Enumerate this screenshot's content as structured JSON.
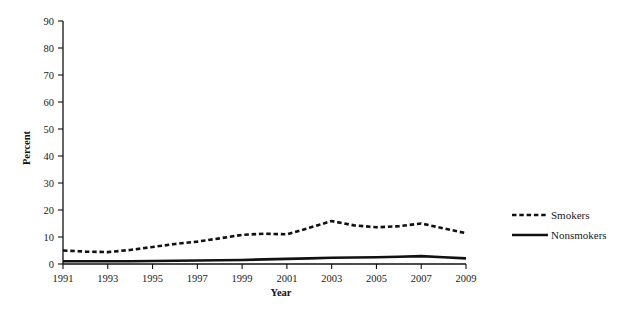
{
  "chart_data": {
    "type": "line",
    "title": "",
    "xlabel": "Year",
    "ylabel": "Percent",
    "xlim": [
      1991,
      2009
    ],
    "ylim": [
      0,
      90
    ],
    "grid": false,
    "legend_position": "right",
    "xticks": [
      "1991",
      "1993",
      "1995",
      "1997",
      "1999",
      "2001",
      "2003",
      "2005",
      "2007",
      "2009"
    ],
    "yticks": [
      "0",
      "10",
      "20",
      "30",
      "40",
      "50",
      "60",
      "70",
      "80",
      "90"
    ],
    "x": [
      1991,
      1992,
      1993,
      1994,
      1995,
      1996,
      1997,
      1998,
      1999,
      2000,
      2001,
      2002,
      2003,
      2004,
      2005,
      2006,
      2007,
      2008,
      2009
    ],
    "series": [
      {
        "name": "Smokers",
        "style": "dashed",
        "color": "#111111",
        "values": [
          5.0,
          4.6,
          4.4,
          5.2,
          6.3,
          7.4,
          8.3,
          9.5,
          10.8,
          11.2,
          11.0,
          13.4,
          15.9,
          14.3,
          13.6,
          14.0,
          15.0,
          13.2,
          11.4
        ]
      },
      {
        "name": "Nonsmokers",
        "style": "solid",
        "color": "#111111",
        "values": [
          1.0,
          1.0,
          1.0,
          1.0,
          1.1,
          1.2,
          1.3,
          1.4,
          1.5,
          1.7,
          1.9,
          2.1,
          2.3,
          2.4,
          2.5,
          2.7,
          2.9,
          2.5,
          2.1
        ]
      }
    ]
  },
  "legend": {
    "items": [
      {
        "label": "Smokers",
        "style": "dashed"
      },
      {
        "label": "Nonsmokers",
        "style": "solid"
      }
    ]
  }
}
